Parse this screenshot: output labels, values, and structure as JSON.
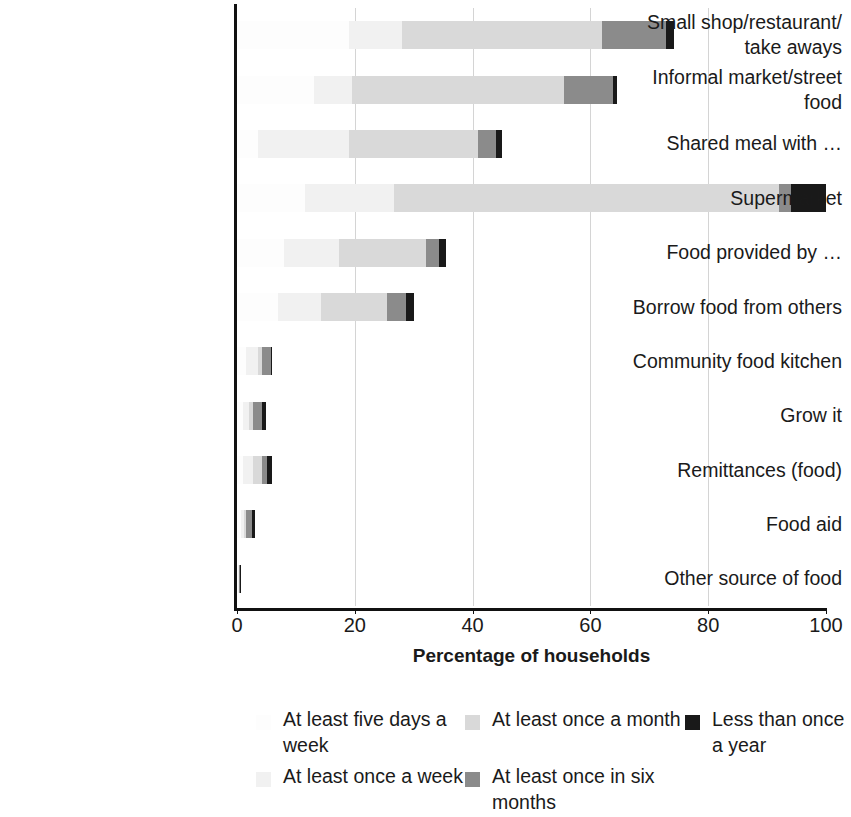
{
  "chart_data": {
    "type": "bar",
    "orientation": "horizontal",
    "stacked": true,
    "title": "",
    "xlabel": "Percentage of households",
    "ylabel": "",
    "xlim": [
      0,
      100
    ],
    "xticks": [
      0,
      20,
      40,
      60,
      80,
      100
    ],
    "grid": "vertical gridlines at 20, 40, 60, 80",
    "legend_position": "bottom",
    "categories": [
      "Small shop/restaurant/\ntake aways",
      "Informal market/street\nfood",
      "Shared meal with …",
      "Supermarket",
      "Food provided by …",
      "Borrow food from others",
      "Community food kitchen",
      "Grow it",
      "Remittances (food)",
      "Food aid",
      "Other source of food"
    ],
    "series": [
      {
        "name": "At least five days a week",
        "color": "#fdfdfd",
        "values": [
          19.0,
          13.0,
          3.5,
          11.5,
          8.0,
          7.0,
          1.5,
          1.0,
          1.0,
          0.6,
          0.2
        ]
      },
      {
        "name": "At least once a week",
        "color": "#f1f1f1",
        "values": [
          9.0,
          6.5,
          15.5,
          15.2,
          9.3,
          7.2,
          2.0,
          1.0,
          1.7,
          0.6,
          0.1
        ]
      },
      {
        "name": "At least once a month",
        "color": "#d9d9d9",
        "values": [
          34.0,
          36.0,
          22.0,
          65.3,
          14.8,
          11.3,
          0.7,
          0.7,
          1.6,
          0.3,
          0.1
        ]
      },
      {
        "name": "At least once in six months",
        "color": "#8b8b8b",
        "values": [
          10.8,
          8.3,
          2.9,
          2.0,
          2.2,
          3.2,
          1.6,
          1.5,
          0.8,
          1.0,
          0.1
        ]
      },
      {
        "name": "Less than once a year",
        "color": "#191919",
        "values": [
          1.4,
          0.7,
          1.1,
          6.0,
          1.2,
          1.3,
          0.2,
          0.8,
          0.9,
          0.5,
          0.1
        ]
      }
    ],
    "totals": [
      74.2,
      64.5,
      45.0,
      100.0,
      35.5,
      30.0,
      6.0,
      5.0,
      6.0,
      3.0,
      0.6
    ]
  },
  "legend": {
    "columns": [
      {
        "items": [
          {
            "label": "At least five days a week",
            "color": "#fdfdfd"
          },
          {
            "label": "At least once a week",
            "color": "#f1f1f1"
          }
        ]
      },
      {
        "items": [
          {
            "label": "At least once a month",
            "color": "#d9d9d9"
          },
          {
            "label": "At least once in six months",
            "color": "#8b8b8b"
          }
        ]
      },
      {
        "items": [
          {
            "label": "Less than once a year",
            "color": "#191919"
          }
        ]
      }
    ]
  }
}
